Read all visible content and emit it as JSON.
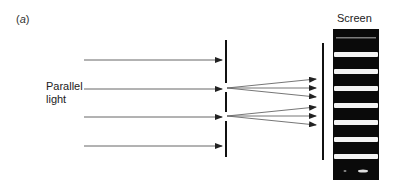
{
  "figure": {
    "panel_label_prefix": "(",
    "panel_label_letter": "a",
    "panel_label_suffix": ")",
    "source_label_line1": "Parallel",
    "source_label_line2": "light",
    "screen_label": "Screen"
  },
  "geometry": {
    "incoming_rays_y": [
      60,
      89,
      117,
      146
    ],
    "incoming_start_x": 84,
    "incoming_end_x": 222,
    "barrier_x": 226,
    "barrier_segments": [
      [
        40,
        83
      ],
      [
        92,
        112
      ],
      [
        121,
        157
      ]
    ],
    "slits_y": [
      88,
      116
    ],
    "diffracted_end_x": 316,
    "diffracted_offsets": [
      -9,
      0,
      9
    ],
    "screen_line_x": 323,
    "screen_line_y": [
      43,
      160
    ],
    "fringe_image": {
      "x": 333,
      "y": 29,
      "width": 46,
      "height": 151
    },
    "bright_fringes_y": [
      52,
      69,
      86,
      103,
      120,
      137,
      154
    ],
    "bright_fringe_height": 5
  },
  "colors": {
    "line": "#333333",
    "arrow_line": "#666666",
    "fringe_dark": "#0a0a0a",
    "fringe_bright": "#f4f4f4"
  }
}
